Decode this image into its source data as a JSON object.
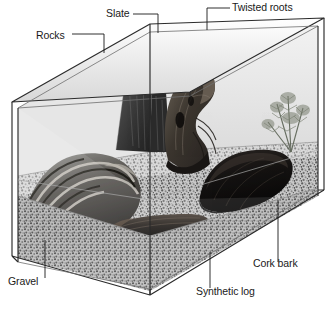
{
  "figure": {
    "type": "labeled-diagram",
    "style": "grayscale stipple illustration",
    "background_color": "#ffffff",
    "ink_color": "#1a1a1a"
  },
  "labels": [
    {
      "id": "rocks",
      "text": "Rocks",
      "x": 36,
      "y": 38,
      "anchor": "start"
    },
    {
      "id": "slate",
      "text": "Slate",
      "x": 106,
      "y": 18,
      "anchor": "start"
    },
    {
      "id": "twisted-roots",
      "text": "Twisted roots",
      "x": 232,
      "y": 11,
      "anchor": "start"
    },
    {
      "id": "gravel",
      "text": "Gravel",
      "x": 8,
      "y": 283,
      "anchor": "start"
    },
    {
      "id": "synthetic-log",
      "text": "Synthetic log",
      "x": 196,
      "y": 292,
      "anchor": "start"
    },
    {
      "id": "cork-bark",
      "text": "Cork bark",
      "x": 253,
      "y": 266,
      "anchor": "start"
    }
  ],
  "parts": [
    {
      "id": "rocks",
      "name": "Rocks",
      "description": "stack of banded layered stones, front left"
    },
    {
      "id": "slate",
      "name": "Slate",
      "description": "upright dark slate slabs, back centre-left"
    },
    {
      "id": "twisted-roots",
      "name": "Twisted roots",
      "description": "gnarled driftwood root mass, centre"
    },
    {
      "id": "gravel",
      "name": "Gravel",
      "description": "speckled substrate covering the tank floor"
    },
    {
      "id": "synthetic-log",
      "name": "Synthetic log",
      "description": "dark artificial log lying flat, front centre"
    },
    {
      "id": "cork-bark",
      "name": "Cork bark",
      "description": "dark curved bark tube, right of centre"
    },
    {
      "id": "plant",
      "name": "Plant",
      "description": "feathery green plant, back right (unlabeled)"
    },
    {
      "id": "tank",
      "name": "Glass tank",
      "description": "open-topped rectangular glass enclosure in perspective"
    }
  ]
}
